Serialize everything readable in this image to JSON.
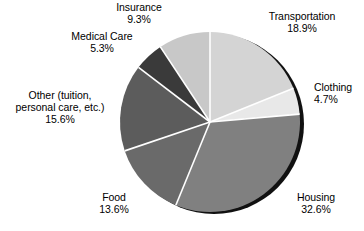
{
  "chart_data": {
    "type": "pie",
    "title": "",
    "subtitle": "",
    "xlabel": "",
    "ylabel": "",
    "legend_position": "none",
    "grid": false,
    "units": "percent",
    "start_angle_deg": 0,
    "direction": "clockwise",
    "categories": [
      "Transportation",
      "Clothing",
      "Housing",
      "Food",
      "Other (tuition, personal care, etc.)",
      "Medical Care",
      "Insurance"
    ],
    "values": [
      18.9,
      4.7,
      32.6,
      13.6,
      15.6,
      5.3,
      9.3
    ],
    "slices": [
      {
        "key": "transportation",
        "label": "Transportation",
        "label_lines": [
          "Transportation"
        ],
        "value": 18.9,
        "value_text": "18.9%",
        "color": "#d4d4d4"
      },
      {
        "key": "clothing",
        "label": "Clothing",
        "label_lines": [
          "Clothing"
        ],
        "value": 4.7,
        "value_text": "4.7%",
        "color": "#e8e8e8"
      },
      {
        "key": "housing",
        "label": "Housing",
        "label_lines": [
          "Housing"
        ],
        "value": 32.6,
        "value_text": "32.6%",
        "color": "#808080"
      },
      {
        "key": "food",
        "label": "Food",
        "label_lines": [
          "Food"
        ],
        "value": 13.6,
        "value_text": "13.6%",
        "color": "#6a6a6a"
      },
      {
        "key": "other",
        "label": "Other (tuition, personal care, etc.)",
        "label_lines": [
          "Other (tuition,",
          "personal care, etc.)"
        ],
        "value": 15.6,
        "value_text": "15.6%",
        "color": "#5c5c5c"
      },
      {
        "key": "medical_care",
        "label": "Medical Care",
        "label_lines": [
          "Medical Care"
        ],
        "value": 5.3,
        "value_text": "5.3%",
        "color": "#3a3a3a"
      },
      {
        "key": "insurance",
        "label": "Insurance",
        "label_lines": [
          "Insurance"
        ],
        "value": 9.3,
        "value_text": "9.3%",
        "color": "#c8c8c8"
      }
    ]
  },
  "style": {
    "background": "#ffffff",
    "text_color": "#000000",
    "separator_color": "#ffffff",
    "shadow_color": "#111111"
  }
}
